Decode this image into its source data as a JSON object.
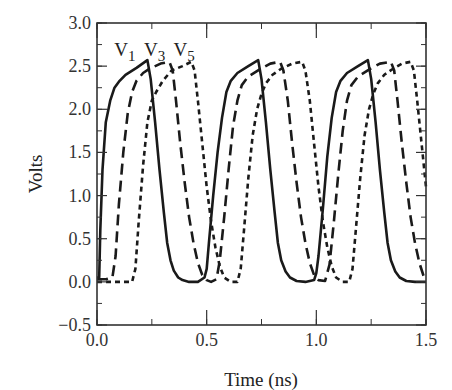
{
  "chart_data": {
    "type": "line",
    "title": "",
    "xlabel": "Time (ns)",
    "ylabel": "Volts",
    "xlim": [
      0.0,
      1.5
    ],
    "ylim": [
      -0.5,
      3.0
    ],
    "xticks": [
      0.0,
      0.5,
      1.0,
      1.5
    ],
    "xtick_labels": [
      "0.0",
      "0.5",
      "1.0",
      "1.5"
    ],
    "xminor_step": 0.25,
    "yticks": [
      -0.5,
      0.0,
      0.5,
      1.0,
      1.5,
      2.0,
      2.5,
      3.0
    ],
    "ytick_labels": [
      "−0.5",
      "0.0",
      "0.5",
      "1.0",
      "1.5",
      "2.0",
      "2.5",
      "3.0"
    ],
    "yminor_step": 0.25,
    "grid": false,
    "legend_position": "inline-top-left",
    "annotations": [
      {
        "text": "V",
        "sub": "1",
        "x": 0.12,
        "y": 2.62
      },
      {
        "text": "V",
        "sub": "3",
        "x": 0.255,
        "y": 2.62
      },
      {
        "text": "V",
        "sub": "5",
        "x": 0.39,
        "y": 2.62
      }
    ],
    "series": [
      {
        "name": "V1",
        "style": "solid",
        "x": [
          0.0,
          0.01,
          0.015,
          0.025,
          0.04,
          0.06,
          0.08,
          0.1,
          0.13,
          0.18,
          0.23,
          0.245,
          0.265,
          0.285,
          0.305,
          0.32,
          0.335,
          0.35,
          0.37,
          0.39,
          0.42,
          0.46,
          0.49,
          0.5,
          0.51,
          0.53,
          0.55,
          0.57,
          0.59,
          0.61,
          0.64,
          0.69,
          0.735,
          0.75,
          0.77,
          0.79,
          0.81,
          0.825,
          0.84,
          0.86,
          0.88,
          0.91,
          0.95,
          0.99,
          1.0,
          1.01,
          1.03,
          1.05,
          1.07,
          1.09,
          1.11,
          1.14,
          1.19,
          1.235,
          1.25,
          1.27,
          1.29,
          1.31,
          1.325,
          1.34,
          1.36,
          1.38,
          1.41,
          1.45,
          1.5
        ],
        "y": [
          0.05,
          0.05,
          0.6,
          1.3,
          1.85,
          2.1,
          2.25,
          2.32,
          2.4,
          2.48,
          2.57,
          2.35,
          1.85,
          1.3,
          0.8,
          0.45,
          0.25,
          0.13,
          0.05,
          0.02,
          0.0,
          0.0,
          0.05,
          0.15,
          0.45,
          1.0,
          1.5,
          1.9,
          2.2,
          2.33,
          2.42,
          2.5,
          2.57,
          2.35,
          1.85,
          1.3,
          0.8,
          0.45,
          0.25,
          0.12,
          0.05,
          0.01,
          0.0,
          0.02,
          0.1,
          0.3,
          0.85,
          1.45,
          1.9,
          2.2,
          2.33,
          2.42,
          2.5,
          2.57,
          2.35,
          1.85,
          1.3,
          0.8,
          0.45,
          0.25,
          0.12,
          0.05,
          0.01,
          0.0,
          0.0
        ]
      },
      {
        "name": "V3",
        "style": "long-dash",
        "x": [
          0.0,
          0.04,
          0.07,
          0.085,
          0.1,
          0.12,
          0.14,
          0.16,
          0.18,
          0.21,
          0.24,
          0.29,
          0.33,
          0.345,
          0.36,
          0.38,
          0.4,
          0.42,
          0.44,
          0.46,
          0.48,
          0.5,
          0.52,
          0.545,
          0.56,
          0.58,
          0.6,
          0.62,
          0.64,
          0.66,
          0.69,
          0.74,
          0.79,
          0.835,
          0.85,
          0.87,
          0.89,
          0.91,
          0.93,
          0.95,
          0.97,
          0.99,
          1.01,
          1.04,
          1.06,
          1.08,
          1.1,
          1.12,
          1.14,
          1.16,
          1.19,
          1.24,
          1.29,
          1.34,
          1.355,
          1.37,
          1.39,
          1.41,
          1.43,
          1.45,
          1.47,
          1.49,
          1.5
        ],
        "y": [
          0.03,
          0.03,
          0.05,
          0.3,
          0.9,
          1.5,
          1.95,
          2.2,
          2.33,
          2.42,
          2.47,
          2.53,
          2.55,
          2.45,
          2.1,
          1.6,
          1.15,
          0.75,
          0.45,
          0.22,
          0.08,
          0.02,
          0.0,
          0.03,
          0.25,
          0.75,
          1.3,
          1.8,
          2.1,
          2.28,
          2.38,
          2.46,
          2.53,
          2.55,
          2.45,
          2.1,
          1.6,
          1.15,
          0.75,
          0.45,
          0.22,
          0.08,
          0.02,
          0.01,
          0.2,
          0.7,
          1.25,
          1.75,
          2.1,
          2.28,
          2.38,
          2.46,
          2.53,
          2.55,
          2.45,
          2.1,
          1.6,
          1.15,
          0.75,
          0.45,
          0.22,
          0.06,
          0.02
        ]
      },
      {
        "name": "V5",
        "style": "short-dash",
        "x": [
          0.0,
          0.1,
          0.16,
          0.175,
          0.19,
          0.21,
          0.23,
          0.25,
          0.27,
          0.3,
          0.34,
          0.39,
          0.43,
          0.445,
          0.46,
          0.48,
          0.5,
          0.52,
          0.54,
          0.56,
          0.58,
          0.61,
          0.64,
          0.655,
          0.67,
          0.69,
          0.71,
          0.73,
          0.75,
          0.77,
          0.8,
          0.84,
          0.89,
          0.935,
          0.95,
          0.97,
          0.99,
          1.01,
          1.03,
          1.05,
          1.07,
          1.09,
          1.12,
          1.15,
          1.165,
          1.18,
          1.2,
          1.22,
          1.24,
          1.26,
          1.28,
          1.31,
          1.35,
          1.39,
          1.43,
          1.445,
          1.46,
          1.48,
          1.5
        ],
        "y": [
          0.0,
          0.0,
          0.0,
          0.15,
          0.7,
          1.35,
          1.85,
          2.1,
          2.2,
          2.33,
          2.45,
          2.5,
          2.55,
          2.45,
          2.1,
          1.6,
          1.1,
          0.7,
          0.4,
          0.18,
          0.05,
          0.0,
          0.0,
          0.15,
          0.6,
          1.2,
          1.7,
          2.0,
          2.18,
          2.3,
          2.4,
          2.47,
          2.53,
          2.55,
          2.45,
          2.1,
          1.6,
          1.1,
          0.7,
          0.4,
          0.18,
          0.05,
          0.0,
          0.0,
          0.15,
          0.6,
          1.2,
          1.7,
          2.0,
          2.18,
          2.3,
          2.4,
          2.47,
          2.53,
          2.55,
          2.45,
          2.1,
          1.6,
          1.1
        ]
      }
    ]
  }
}
